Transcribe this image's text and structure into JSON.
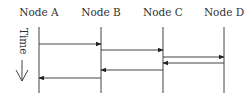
{
  "diagram": {
    "type": "sequence-diagram",
    "nodes": [
      {
        "label": "Node A",
        "x": 39
      },
      {
        "label": "Node B",
        "x": 101
      },
      {
        "label": "Node C",
        "x": 163
      },
      {
        "label": "Node D",
        "x": 224
      }
    ],
    "time_axis": {
      "label": "Time",
      "direction": "down"
    },
    "messages": [
      {
        "from": "Node A",
        "to": "Node B",
        "y": 44
      },
      {
        "from": "Node B",
        "to": "Node C",
        "y": 50
      },
      {
        "from": "Node C",
        "to": "Node D",
        "y": 57
      },
      {
        "from": "Node D",
        "to": "Node C",
        "y": 63
      },
      {
        "from": "Node C",
        "to": "Node B",
        "y": 70
      },
      {
        "from": "Node B",
        "to": "Node A",
        "y": 78
      }
    ],
    "colors": {
      "line": "#333333",
      "text": "#333333",
      "background": "#ffffff"
    }
  }
}
